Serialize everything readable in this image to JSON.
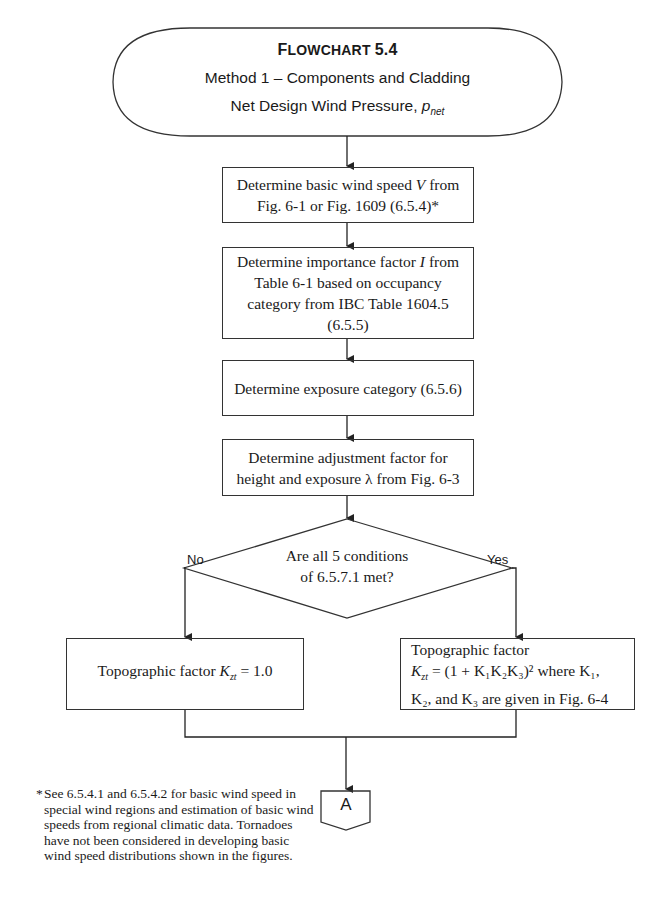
{
  "header": {
    "title_prefix": "F",
    "title_rest": "LOWCHART",
    "title_number": "5.4",
    "subtitle": "Method 1 – Components and Cladding",
    "subtitle2": "Net Design Wind Pressure,",
    "symbol": "p",
    "symbol_sub": "net"
  },
  "steps": [
    {
      "line1_pre": "Determine basic wind speed ",
      "var": "V",
      "line1_post": " from",
      "line2": "Fig. 6-1 or Fig. 1609 (6.5.4)*"
    },
    {
      "line1_pre": "Determine importance factor ",
      "var": "I",
      "line1_post": " from",
      "line2": "Table 6-1 based on occupancy",
      "line3": "category from IBC Table 1604.5",
      "line4": "(6.5.5)"
    },
    {
      "line1": "Determine exposure category (6.5.6)"
    },
    {
      "line1": "Determine adjustment factor for",
      "line2": "height and exposure λ  from Fig. 6-3"
    }
  ],
  "decision": {
    "line1": "Are all 5 conditions",
    "line2": "of 6.5.7.1 met?",
    "no_label": "No",
    "yes_label": "Yes"
  },
  "outcome_no": {
    "text": "Topographic factor ",
    "var": "K",
    "var_sub": "zt",
    "value": " = 1.0"
  },
  "outcome_yes": {
    "line1": "Topographic factor",
    "formula_var": "K",
    "formula_sub": "zt",
    "formula": " = (1 + K₁K₂K₃)² where K₁,",
    "line3": "K₂, and K₃ are given in Fig. 6-4"
  },
  "connector": {
    "label": "A"
  },
  "footnote": {
    "marker": "*",
    "lines": [
      "See 6.5.4.1 and 6.5.4.2 for basic wind speed in",
      "special wind regions and estimation of basic wind",
      "speeds from regional climatic data. Tornadoes",
      "have not been considered in developing basic",
      "wind speed distributions shown in the figures."
    ]
  }
}
